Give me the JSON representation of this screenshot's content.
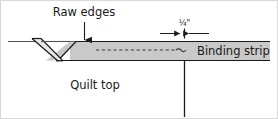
{
  "figure": {
    "background_color": "#ffffff",
    "width": 278,
    "height": 119
  },
  "labels": {
    "raw_edges": "Raw edges",
    "quilt_top": "Quilt top",
    "binding_strip": "Binding strip",
    "seam_allowance": "¼\""
  },
  "colors": {
    "strip_fill": "#c9c9c9",
    "strip_fill_light": "#d6d6d6",
    "outline": "#1a1a1a",
    "text": "#1a1a1a",
    "quilt_edge_line": "#555555",
    "stitch_line": "#3a3a3a",
    "frame": "#d8d8d8"
  },
  "elements": {
    "binding_strip_band": "horizontal gray strip across upper area",
    "folded_tail": "V-shaped folded angled end of binding strip at left",
    "stitch_line": "dashed stitching line inside binding strip",
    "raw_edges_leader": "vertical leader line with solid arrowhead pointing down to strip top edge",
    "dimension_callout": "two opposing arrows with center tick marking seam allowance",
    "quilt_edge": "horizontal line marking top edge of quilt",
    "vertical_drop_line": "vertical line descending from strip bottom edge"
  }
}
